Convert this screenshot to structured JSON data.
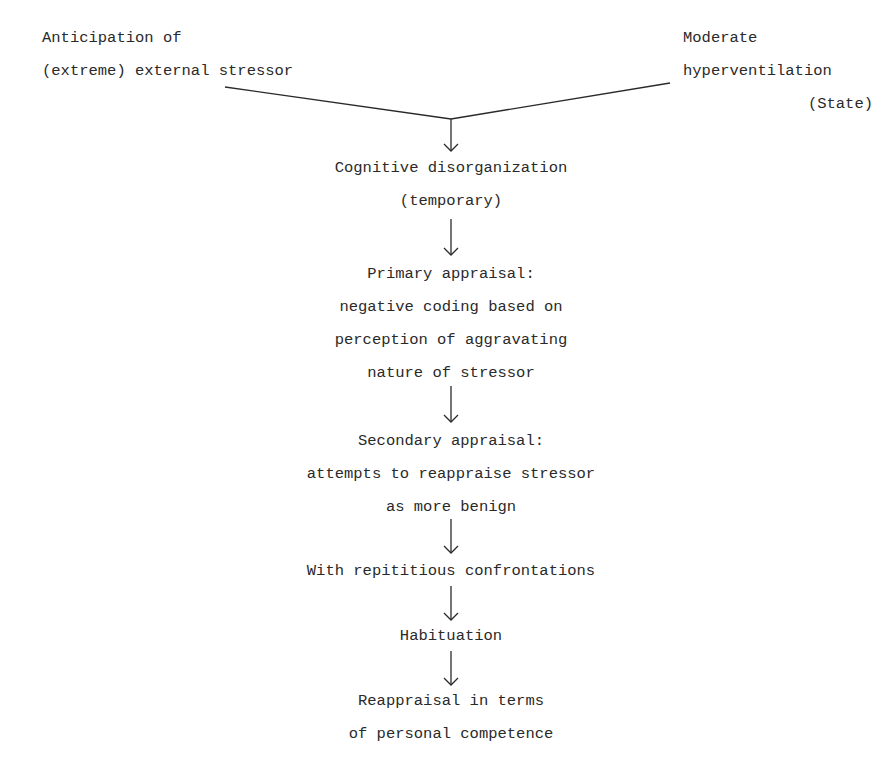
{
  "diagram": {
    "type": "flowchart",
    "inputs": {
      "left": {
        "lines": [
          "Anticipation of",
          "(extreme) external stressor"
        ]
      },
      "right": {
        "lines": [
          "Moderate",
          "hyperventilation",
          "(State)"
        ]
      }
    },
    "steps": [
      {
        "lines": [
          "Cognitive disorganization",
          "(temporary)"
        ]
      },
      {
        "lines": [
          "Primary appraisal:",
          "negative coding based on",
          "perception of aggravating",
          "nature of stressor"
        ]
      },
      {
        "lines": [
          "Secondary appraisal:",
          "attempts to reappraise stressor",
          "as more benign"
        ]
      },
      {
        "lines": [
          "With repititious confrontations"
        ]
      },
      {
        "lines": [
          "Habituation"
        ]
      },
      {
        "lines": [
          "Reappraisal in terms",
          "of personal competence"
        ]
      }
    ],
    "colors": {
      "ink": "#2a2a2a",
      "background": "#ffffff"
    }
  }
}
